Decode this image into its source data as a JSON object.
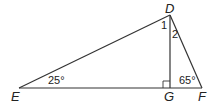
{
  "figure": {
    "type": "triangle-diagram",
    "vertices": {
      "D": {
        "label": "D",
        "x": 170,
        "y": 15
      },
      "E": {
        "label": "E",
        "x": 19,
        "y": 88
      },
      "G": {
        "label": "G",
        "x": 170,
        "y": 88
      },
      "F": {
        "label": "F",
        "x": 202,
        "y": 88
      }
    },
    "segments": [
      "DE",
      "DF",
      "EF",
      "DG"
    ],
    "angles": {
      "angle_E": "25°",
      "angle_F": "65°",
      "angle_1": "1",
      "angle_2": "2",
      "angle_G": "right angle"
    },
    "colors": {
      "line": "#333333",
      "text": "#222222"
    }
  }
}
